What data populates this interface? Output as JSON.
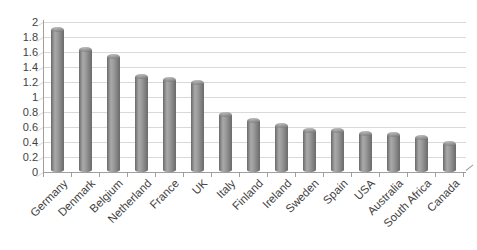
{
  "chart_data": {
    "type": "bar",
    "bar_style": "cylinder-3d",
    "categories": [
      "Germany",
      "Denmark",
      "Belgium",
      "Netherland",
      "France",
      "UK",
      "Italy",
      "Finland",
      "Ireland",
      "Sweden",
      "Spain",
      "USA",
      "Australia",
      "South Africa",
      "Canada"
    ],
    "values": [
      1.93,
      1.66,
      1.57,
      1.3,
      1.27,
      1.22,
      0.8,
      0.72,
      0.65,
      0.59,
      0.58,
      0.54,
      0.53,
      0.49,
      0.41
    ],
    "ylim": [
      0,
      2
    ],
    "y_tick_step": 0.2,
    "y_tick_labels": [
      "0",
      "0.2",
      "0.4",
      "0.6",
      "0.8",
      "1",
      "1.2",
      "1.4",
      "1.6",
      "1.8",
      "2"
    ],
    "x_label_rotation_deg": 45,
    "grid": true,
    "legend": "none"
  },
  "colors": {
    "background": "#ffffff",
    "bar_body": "#9b9b9b",
    "bar_highlight": "#a9a9a9",
    "bar_shadow": "#6a6a6a",
    "gridline": "#d9d9d9",
    "axis_line": "#9f9f9f",
    "tick_text": "#3f3f3f"
  }
}
